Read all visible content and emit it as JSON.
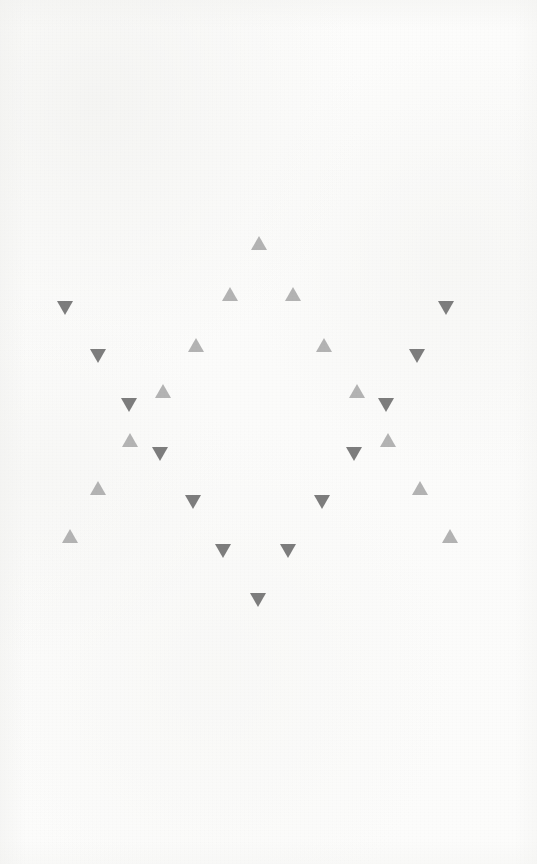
{
  "scene": {
    "title": "Triangle Star Pattern",
    "width": 537,
    "height": 864,
    "background_color": "#fcfcfb",
    "texture": "paper-grain"
  },
  "style": {
    "up_color": "#b3b3b3",
    "down_color": "#7d7d7d",
    "triangle_width": 16,
    "triangle_height": 14
  },
  "chart_data": {
    "type": "scatter",
    "xlabel": "",
    "ylabel": "",
    "xlim": [
      0,
      537
    ],
    "ylim": [
      0,
      864
    ],
    "grid": false,
    "legend_position": "none",
    "series": [
      {
        "name": "up-triangles",
        "marker": "triangle-up",
        "color": "#b3b3b3",
        "count": 15,
        "points": [
          [
            259,
            243
          ],
          [
            230,
            294
          ],
          [
            293,
            294
          ],
          [
            196,
            345
          ],
          [
            324,
            345
          ],
          [
            163,
            391
          ],
          [
            357,
            391
          ],
          [
            130,
            438
          ],
          [
            388,
            438
          ],
          [
            98,
            488
          ],
          [
            420,
            488
          ],
          [
            70,
            536
          ],
          [
            450,
            536
          ],
          [
            162,
            393
          ],
          [
            387,
            442
          ]
        ]
      },
      {
        "name": "down-triangles",
        "marker": "triangle-down",
        "color": "#7d7d7d",
        "count": 15,
        "points": [
          [
            65,
            308
          ],
          [
            446,
            308
          ],
          [
            98,
            356
          ],
          [
            417,
            356
          ],
          [
            129,
            405
          ],
          [
            386,
            405
          ],
          [
            160,
            454
          ],
          [
            354,
            454
          ],
          [
            193,
            502
          ],
          [
            322,
            502
          ],
          [
            223,
            551
          ],
          [
            288,
            551
          ],
          [
            258,
            600
          ],
          [
            130,
            440
          ],
          [
            385,
            407
          ]
        ]
      }
    ]
  },
  "triangles": [
    {
      "id": "u1",
      "dir": "up",
      "x": 259,
      "y": 243
    },
    {
      "id": "u2",
      "dir": "up",
      "x": 230,
      "y": 294
    },
    {
      "id": "u3",
      "dir": "up",
      "x": 293,
      "y": 294
    },
    {
      "id": "u4",
      "dir": "up",
      "x": 196,
      "y": 345
    },
    {
      "id": "u5",
      "dir": "up",
      "x": 324,
      "y": 345
    },
    {
      "id": "u6",
      "dir": "up",
      "x": 163,
      "y": 391
    },
    {
      "id": "u7",
      "dir": "up",
      "x": 357,
      "y": 391
    },
    {
      "id": "u8",
      "dir": "up",
      "x": 130,
      "y": 440
    },
    {
      "id": "u9",
      "dir": "up",
      "x": 388,
      "y": 440
    },
    {
      "id": "u10",
      "dir": "up",
      "x": 98,
      "y": 488
    },
    {
      "id": "u11",
      "dir": "up",
      "x": 420,
      "y": 488
    },
    {
      "id": "u12",
      "dir": "up",
      "x": 70,
      "y": 536
    },
    {
      "id": "u13",
      "dir": "up",
      "x": 450,
      "y": 536
    },
    {
      "id": "d1",
      "dir": "down",
      "x": 65,
      "y": 308
    },
    {
      "id": "d2",
      "dir": "down",
      "x": 446,
      "y": 308
    },
    {
      "id": "d3",
      "dir": "down",
      "x": 98,
      "y": 356
    },
    {
      "id": "d4",
      "dir": "down",
      "x": 417,
      "y": 356
    },
    {
      "id": "d5",
      "dir": "down",
      "x": 129,
      "y": 405
    },
    {
      "id": "d6",
      "dir": "down",
      "x": 386,
      "y": 405
    },
    {
      "id": "d7",
      "dir": "down",
      "x": 160,
      "y": 454
    },
    {
      "id": "d8",
      "dir": "down",
      "x": 354,
      "y": 454
    },
    {
      "id": "d9",
      "dir": "down",
      "x": 193,
      "y": 502
    },
    {
      "id": "d10",
      "dir": "down",
      "x": 322,
      "y": 502
    },
    {
      "id": "d11",
      "dir": "down",
      "x": 223,
      "y": 551
    },
    {
      "id": "d12",
      "dir": "down",
      "x": 288,
      "y": 551
    },
    {
      "id": "d13",
      "dir": "down",
      "x": 258,
      "y": 600
    }
  ]
}
